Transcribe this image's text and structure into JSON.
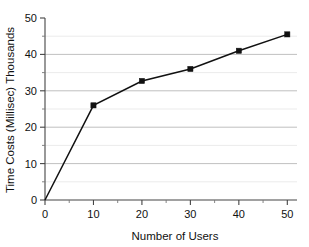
{
  "chart_data": {
    "type": "line",
    "title": "",
    "xlabel": "Number of Users",
    "ylabel": "Time Costs (Millisec) Thousands",
    "x": [
      0,
      10,
      20,
      30,
      40,
      50
    ],
    "values": [
      0,
      26,
      32.7,
      36,
      41,
      45.5
    ],
    "series": [
      {
        "name": "Time Costs",
        "x": [
          0,
          10,
          20,
          30,
          40,
          50
        ],
        "values": [
          0,
          26,
          32.7,
          36,
          41,
          45.5
        ]
      }
    ],
    "xlim": [
      0,
      52
    ],
    "ylim": [
      0,
      50
    ],
    "x_ticks": [
      0,
      10,
      20,
      30,
      40,
      50
    ],
    "x_tick_labels": [
      "0",
      "10",
      "20",
      "30",
      "40",
      "50"
    ],
    "x_minor_ticks": [
      5,
      15,
      25,
      35,
      45
    ],
    "y_ticks": [
      0,
      10,
      20,
      30,
      40,
      50
    ],
    "y_tick_labels": [
      "0",
      "10",
      "20",
      "30",
      "40",
      "50"
    ],
    "y_minor_ticks": [
      5,
      15,
      25,
      35,
      45
    ],
    "grid": true,
    "grid_axis": "y",
    "legend": false,
    "legend_position": "none",
    "marker": "square",
    "line_color": "#111111",
    "marker_color": "#111111",
    "grid_major_color": "#b9b9b9",
    "grid_minor_color": "#e6e6e6",
    "background_color": "#ffffff"
  }
}
